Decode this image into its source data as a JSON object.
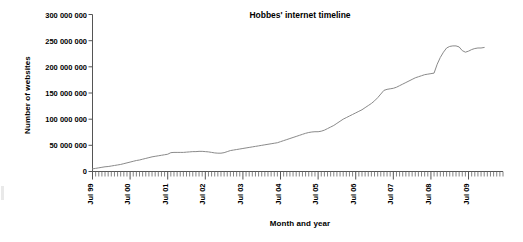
{
  "chart": {
    "title": "Hobbes' internet timeline",
    "xlabel": "Month and year",
    "ylabel": "Number of websites"
  },
  "yticks": [
    {
      "label": "300 000 000",
      "value": 300000000
    },
    {
      "label": "250 000 000",
      "value": 250000000
    },
    {
      "label": "200 000 000",
      "value": 200000000
    },
    {
      "label": "150 000 000",
      "value": 150000000
    },
    {
      "label": "100 000 000",
      "value": 100000000
    },
    {
      "label": "50 000 000",
      "value": 50000000
    },
    {
      "label": "0",
      "value": 0
    }
  ],
  "xticks": [
    {
      "label": "Jul 99",
      "index": 0
    },
    {
      "label": "Jul 00",
      "index": 12
    },
    {
      "label": "Jul 01",
      "index": 24
    },
    {
      "label": "Jul 02",
      "index": 36
    },
    {
      "label": "Jul 03",
      "index": 48
    },
    {
      "label": "Jul 04",
      "index": 60
    },
    {
      "label": "Jul 05",
      "index": 72
    },
    {
      "label": "Jul 06",
      "index": 84
    },
    {
      "label": "Jul 07",
      "index": 96
    },
    {
      "label": "Jul 08",
      "index": 108
    },
    {
      "label": "Jul 09",
      "index": 120
    }
  ],
  "colors": {
    "line": "#8a8a8a",
    "axis": "#555555",
    "text": "#1a1a1a",
    "background": "#ffffff"
  },
  "chart_data": {
    "type": "line",
    "title": "Hobbes' internet timeline",
    "xlabel": "Month and year",
    "ylabel": "Number of websites",
    "ylim": [
      0,
      300000000
    ],
    "ytick_values": [
      0,
      50000000,
      100000000,
      150000000,
      200000000,
      250000000,
      300000000
    ],
    "ytick_labels": [
      "0",
      "50 000 000",
      "100 000 000",
      "150 000 000",
      "200 000 000",
      "250 000 000",
      "300 000 000"
    ],
    "grid": false,
    "legend": null,
    "x_tick_labels": [
      "Jul 99",
      "Jul 00",
      "Jul 01",
      "Jul 02",
      "Jul 03",
      "Jul 04",
      "Jul 05",
      "Jul 06",
      "Jul 07",
      "Jul 08",
      "Jul 09"
    ],
    "x_minor_tick_interval_months": 1,
    "x_major_tick_interval_months": 12,
    "x_start": "Jul 99",
    "x_end": "Jan 10",
    "series": [
      {
        "name": "Number of websites",
        "x": [
          "Jul 99",
          "Aug 99",
          "Sep 99",
          "Oct 99",
          "Nov 99",
          "Dec 99",
          "Jan 00",
          "Feb 00",
          "Mar 00",
          "Apr 00",
          "May 00",
          "Jun 00",
          "Jul 00",
          "Aug 00",
          "Sep 00",
          "Oct 00",
          "Nov 00",
          "Dec 00",
          "Jan 01",
          "Feb 01",
          "Mar 01",
          "Apr 01",
          "May 01",
          "Jun 01",
          "Jul 01",
          "Aug 01",
          "Sep 01",
          "Oct 01",
          "Nov 01",
          "Dec 01",
          "Jan 02",
          "Feb 02",
          "Mar 02",
          "Apr 02",
          "May 02",
          "Jun 02",
          "Jul 02",
          "Aug 02",
          "Sep 02",
          "Oct 02",
          "Nov 02",
          "Dec 02",
          "Jan 03",
          "Feb 03",
          "Mar 03",
          "Apr 03",
          "May 03",
          "Jun 03",
          "Jul 03",
          "Aug 03",
          "Sep 03",
          "Oct 03",
          "Nov 03",
          "Dec 03",
          "Jan 04",
          "Feb 04",
          "Mar 04",
          "Apr 04",
          "May 04",
          "Jun 04",
          "Jul 04",
          "Aug 04",
          "Sep 04",
          "Oct 04",
          "Nov 04",
          "Dec 04",
          "Jan 05",
          "Feb 05",
          "Mar 05",
          "Apr 05",
          "May 05",
          "Jun 05",
          "Jul 05",
          "Aug 05",
          "Sep 05",
          "Oct 05",
          "Nov 05",
          "Dec 05",
          "Jan 06",
          "Feb 06",
          "Mar 06",
          "Apr 06",
          "May 06",
          "Jun 06",
          "Jul 06",
          "Aug 06",
          "Sep 06",
          "Oct 06",
          "Nov 06",
          "Dec 06",
          "Jan 07",
          "Feb 07",
          "Mar 07",
          "Apr 07",
          "May 07",
          "Jun 07",
          "Jul 07",
          "Aug 07",
          "Sep 07",
          "Oct 07",
          "Nov 07",
          "Dec 07",
          "Jan 08",
          "Feb 08",
          "Mar 08",
          "Apr 08",
          "May 08",
          "Jun 08",
          "Jul 08",
          "Aug 08",
          "Sep 08",
          "Oct 08",
          "Nov 08",
          "Dec 08",
          "Jan 09",
          "Feb 09",
          "Mar 09",
          "Apr 09",
          "May 09",
          "Jun 09",
          "Jul 09",
          "Aug 09",
          "Sep 09",
          "Oct 09",
          "Nov 09",
          "Dec 09"
        ],
        "values": [
          5000000,
          6000000,
          7000000,
          8000000,
          9000000,
          9500000,
          10500000,
          11500000,
          12500000,
          13500000,
          15000000,
          16500000,
          18000000,
          19500000,
          21000000,
          22000000,
          23500000,
          25000000,
          26500000,
          28000000,
          29000000,
          30000000,
          31000000,
          32000000,
          33000000,
          36000000,
          36500000,
          36500000,
          36500000,
          36500000,
          37000000,
          37500000,
          38000000,
          38000000,
          38500000,
          38500000,
          38000000,
          37500000,
          36500000,
          35500000,
          35000000,
          35000000,
          36000000,
          38000000,
          40000000,
          41000000,
          42000000,
          43000000,
          44000000,
          45000000,
          46000000,
          47000000,
          48000000,
          49000000,
          50000000,
          51000000,
          52000000,
          53000000,
          54000000,
          55000000,
          57000000,
          59000000,
          61000000,
          63000000,
          65000000,
          67000000,
          69000000,
          71000000,
          73000000,
          74500000,
          75500000,
          76000000,
          76000000,
          77000000,
          79000000,
          82000000,
          85000000,
          88000000,
          92000000,
          96000000,
          100000000,
          103000000,
          106000000,
          109000000,
          112000000,
          115000000,
          118000000,
          122000000,
          126000000,
          130000000,
          135000000,
          141000000,
          148000000,
          155000000,
          157000000,
          158000000,
          159000000,
          161000000,
          164000000,
          167000000,
          170000000,
          173000000,
          176000000,
          179000000,
          181000000,
          183000000,
          185000000,
          186000000,
          187000000,
          188000000,
          205000000,
          218000000,
          228000000,
          236000000,
          239000000,
          240000000,
          240000000,
          238000000,
          231000000,
          228000000,
          230000000,
          233000000,
          235000000,
          236000000,
          236000000,
          237000000
        ]
      }
    ]
  }
}
